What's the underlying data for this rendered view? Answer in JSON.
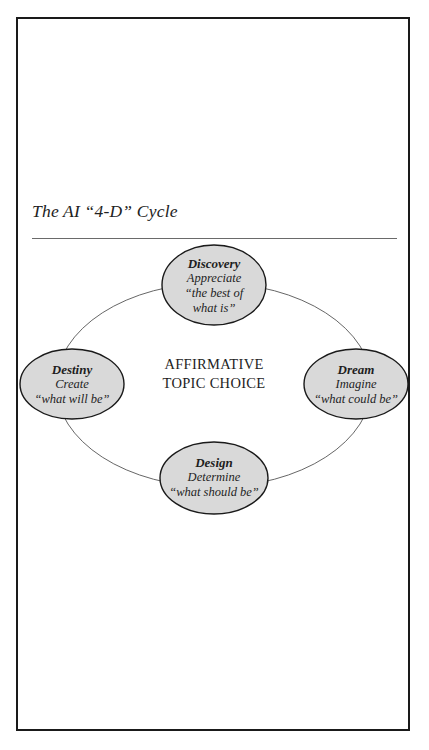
{
  "title": "The AI “4-D” Cycle",
  "center": {
    "line1": "AFFIRMATIVE",
    "line2": "TOPIC CHOICE"
  },
  "nodes": {
    "discovery": {
      "name": "Discovery",
      "verb": "Appreciate",
      "quote_line1": "“the best of",
      "quote_line2": "what is”"
    },
    "dream": {
      "name": "Dream",
      "verb": "Imagine",
      "quote": "“what could be”"
    },
    "design": {
      "name": "Design",
      "verb": "Determine",
      "quote": "“what should be”"
    },
    "destiny": {
      "name": "Destiny",
      "verb": "Create",
      "quote": "“what will be”"
    }
  },
  "colors": {
    "node_fill": "#d9d9d9",
    "node_stroke": "#1a1a1a",
    "cycle_stroke": "#555555",
    "frame": "#1a1a1a"
  }
}
